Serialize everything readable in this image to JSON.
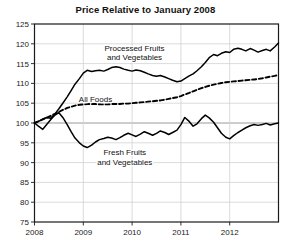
{
  "chart_data": {
    "type": "line",
    "title": "Price Relative to January 2008",
    "xlabel": "",
    "ylabel": "",
    "xlim": [
      2008.0,
      2013.0
    ],
    "ylim": [
      75,
      125
    ],
    "yticks": [
      75,
      80,
      85,
      90,
      95,
      100,
      105,
      110,
      115,
      120,
      125
    ],
    "xticks": [
      2008,
      2009,
      2010,
      2011,
      2012
    ],
    "xtick_labels": [
      "2008",
      "2009",
      "2010",
      "2011",
      "2012"
    ],
    "grid": true,
    "legend": "inline-annotations",
    "annotations": [
      {
        "name": "processed-label",
        "text": "Processed Fruits\nand Vegetables",
        "line1": "Processed Fruits",
        "line2": "and Vegetables",
        "x": 2010.05,
        "y": 118.2
      },
      {
        "name": "all-foods-label",
        "text": "All Foods",
        "line1": "All Foods",
        "line2": "",
        "x": 2009.25,
        "y": 105.4
      },
      {
        "name": "fresh-label",
        "text": "Fresh Fruits\nand Vegetables",
        "line1": "Fresh Fruits",
        "line2": "and Vegetables",
        "x": 2009.85,
        "y": 91.8
      }
    ],
    "series": [
      {
        "name": "Processed Fruits and Vegetables",
        "style": "solid",
        "color": "#000000",
        "x": [
          2008.0,
          2008.08,
          2008.17,
          2008.25,
          2008.33,
          2008.42,
          2008.5,
          2008.58,
          2008.67,
          2008.75,
          2008.83,
          2008.92,
          2009.0,
          2009.08,
          2009.17,
          2009.25,
          2009.33,
          2009.42,
          2009.5,
          2009.58,
          2009.67,
          2009.75,
          2009.83,
          2009.92,
          2010.0,
          2010.08,
          2010.17,
          2010.25,
          2010.33,
          2010.42,
          2010.5,
          2010.58,
          2010.67,
          2010.75,
          2010.83,
          2010.92,
          2011.0,
          2011.08,
          2011.17,
          2011.25,
          2011.33,
          2011.42,
          2011.5,
          2011.58,
          2011.67,
          2011.75,
          2011.83,
          2011.92,
          2012.0,
          2012.08,
          2012.17,
          2012.25,
          2012.33,
          2012.42,
          2012.5,
          2012.58,
          2012.67,
          2012.75,
          2012.83,
          2012.92,
          2013.0
        ],
        "y": [
          100.0,
          100.4,
          101.0,
          101.4,
          101.2,
          102.3,
          103.6,
          105.0,
          106.6,
          108.2,
          109.8,
          111.2,
          112.6,
          113.3,
          113.0,
          113.2,
          113.3,
          113.1,
          113.5,
          114.0,
          114.2,
          114.0,
          113.6,
          113.3,
          113.1,
          113.4,
          113.2,
          112.8,
          112.4,
          112.0,
          111.8,
          112.0,
          111.6,
          111.2,
          110.8,
          110.4,
          110.6,
          111.2,
          111.9,
          112.4,
          113.2,
          114.2,
          115.3,
          116.5,
          117.3,
          117.0,
          117.6,
          118.0,
          117.8,
          118.6,
          118.9,
          118.6,
          118.2,
          118.8,
          118.4,
          117.9,
          118.3,
          118.6,
          118.2,
          119.2,
          120.2
        ]
      },
      {
        "name": "All Foods",
        "style": "dashed",
        "color": "#000000",
        "x": [
          2008.0,
          2008.08,
          2008.17,
          2008.25,
          2008.33,
          2008.42,
          2008.5,
          2008.58,
          2008.67,
          2008.75,
          2008.83,
          2008.92,
          2009.0,
          2009.08,
          2009.17,
          2009.25,
          2009.33,
          2009.42,
          2009.5,
          2009.58,
          2009.67,
          2009.75,
          2009.83,
          2009.92,
          2010.0,
          2010.08,
          2010.17,
          2010.25,
          2010.33,
          2010.42,
          2010.5,
          2010.58,
          2010.67,
          2010.75,
          2010.83,
          2010.92,
          2011.0,
          2011.08,
          2011.17,
          2011.25,
          2011.33,
          2011.42,
          2011.5,
          2011.58,
          2011.67,
          2011.75,
          2011.83,
          2011.92,
          2012.0,
          2012.08,
          2012.17,
          2012.25,
          2012.33,
          2012.42,
          2012.5,
          2012.58,
          2012.67,
          2012.75,
          2012.83,
          2012.92,
          2013.0
        ],
        "y": [
          100.0,
          100.4,
          100.9,
          101.3,
          101.8,
          102.3,
          102.8,
          103.3,
          103.8,
          104.1,
          104.4,
          104.6,
          104.7,
          104.8,
          104.8,
          104.8,
          104.7,
          104.7,
          104.7,
          104.8,
          104.8,
          104.8,
          104.9,
          104.9,
          105.0,
          105.1,
          105.2,
          105.3,
          105.4,
          105.5,
          105.6,
          105.7,
          105.9,
          106.1,
          106.3,
          106.5,
          106.8,
          107.2,
          107.6,
          108.0,
          108.4,
          108.8,
          109.1,
          109.4,
          109.7,
          109.9,
          110.1,
          110.3,
          110.4,
          110.5,
          110.6,
          110.7,
          110.8,
          110.9,
          111.0,
          111.1,
          111.3,
          111.5,
          111.7,
          111.9,
          112.1
        ]
      },
      {
        "name": "Fresh Fruits and Vegetables",
        "style": "solid",
        "color": "#000000",
        "x": [
          2008.0,
          2008.08,
          2008.17,
          2008.25,
          2008.33,
          2008.42,
          2008.5,
          2008.58,
          2008.67,
          2008.75,
          2008.83,
          2008.92,
          2009.0,
          2009.08,
          2009.17,
          2009.25,
          2009.33,
          2009.42,
          2009.5,
          2009.58,
          2009.67,
          2009.75,
          2009.83,
          2009.92,
          2010.0,
          2010.08,
          2010.17,
          2010.25,
          2010.33,
          2010.42,
          2010.5,
          2010.58,
          2010.67,
          2010.75,
          2010.83,
          2010.92,
          2011.0,
          2011.08,
          2011.17,
          2011.25,
          2011.33,
          2011.42,
          2011.5,
          2011.58,
          2011.67,
          2011.75,
          2011.83,
          2011.92,
          2012.0,
          2012.08,
          2012.17,
          2012.25,
          2012.33,
          2012.42,
          2012.5,
          2012.58,
          2012.67,
          2012.75,
          2012.83,
          2012.92,
          2013.0
        ],
        "y": [
          100.0,
          99.2,
          98.4,
          99.6,
          100.8,
          102.0,
          102.6,
          101.4,
          99.6,
          97.8,
          96.2,
          95.0,
          94.2,
          93.8,
          94.4,
          95.2,
          95.8,
          96.1,
          96.4,
          96.2,
          95.8,
          96.3,
          96.9,
          97.4,
          97.0,
          96.6,
          97.2,
          97.8,
          97.4,
          96.9,
          97.4,
          98.0,
          97.6,
          97.1,
          97.6,
          98.2,
          99.6,
          101.4,
          100.4,
          99.2,
          99.8,
          101.1,
          102.0,
          101.3,
          100.2,
          98.8,
          97.4,
          96.4,
          96.0,
          96.8,
          97.6,
          98.2,
          98.8,
          99.3,
          99.6,
          99.4,
          99.6,
          99.9,
          99.5,
          99.8,
          100.0
        ]
      }
    ]
  }
}
